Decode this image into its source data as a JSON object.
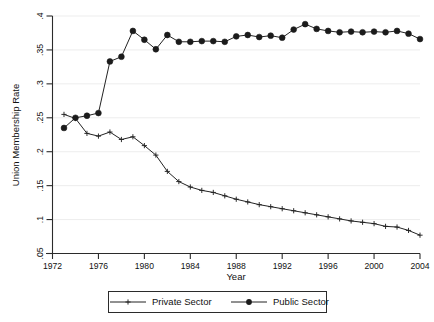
{
  "chart_data": {
    "type": "line",
    "title": "",
    "xlabel": "Year",
    "ylabel": "Union Membership Rate",
    "xlim": [
      1972,
      2004
    ],
    "ylim": [
      0.05,
      0.4
    ],
    "xticks": [
      1972,
      1976,
      1980,
      1984,
      1988,
      1992,
      1996,
      2000,
      2004
    ],
    "xtick_labels": [
      "1972",
      "1976",
      "1980",
      "1984",
      "1988",
      "1992",
      "1996",
      "2000",
      "2004"
    ],
    "yticks": [
      0.05,
      0.1,
      0.15,
      0.2,
      0.25,
      0.3,
      0.35,
      0.4
    ],
    "ytick_labels": [
      ".05",
      ".1",
      ".15",
      ".2",
      ".25",
      ".3",
      ".35",
      ".4"
    ],
    "grid": true,
    "grid_axis": "y",
    "legend_position": "bottom-outside",
    "x": [
      1973,
      1974,
      1975,
      1976,
      1977,
      1978,
      1979,
      1980,
      1981,
      1982,
      1983,
      1984,
      1985,
      1986,
      1987,
      1988,
      1989,
      1990,
      1991,
      1992,
      1993,
      1994,
      1995,
      1996,
      1997,
      1998,
      1999,
      2000,
      2001,
      2002,
      2003,
      2004
    ],
    "series": [
      {
        "name": "Private Sector",
        "marker": "plus",
        "color": "#232323",
        "values": [
          0.255,
          0.249,
          0.227,
          0.223,
          0.229,
          0.218,
          0.222,
          0.209,
          0.195,
          0.171,
          0.156,
          0.148,
          0.143,
          0.14,
          0.135,
          0.13,
          0.126,
          0.122,
          0.119,
          0.116,
          0.113,
          0.11,
          0.107,
          0.104,
          0.101,
          0.098,
          0.096,
          0.094,
          0.09,
          0.089,
          0.084,
          0.077
        ]
      },
      {
        "name": "Public Sector",
        "marker": "circle",
        "color": "#1b1b1b",
        "values": [
          0.235,
          0.25,
          0.253,
          0.257,
          0.333,
          0.34,
          0.378,
          0.365,
          0.351,
          0.372,
          0.362,
          0.362,
          0.363,
          0.363,
          0.362,
          0.37,
          0.372,
          0.369,
          0.371,
          0.368,
          0.38,
          0.388,
          0.381,
          0.378,
          0.376,
          0.377,
          0.376,
          0.377,
          0.376,
          0.378,
          0.374,
          0.366
        ]
      }
    ],
    "legend": [
      {
        "label": "Private Sector",
        "marker": "plus"
      },
      {
        "label": "Public Sector",
        "marker": "circle"
      }
    ]
  }
}
